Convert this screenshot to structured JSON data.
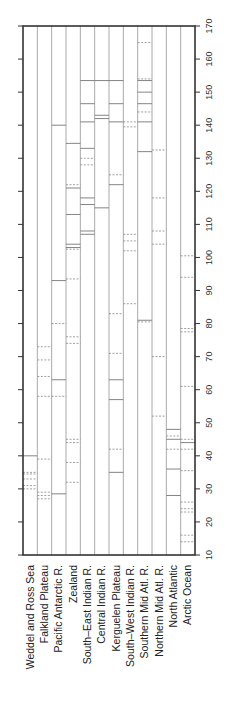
{
  "chart_data": {
    "type": "bar",
    "orientation": "rotated-90",
    "title": "",
    "xlabel": "",
    "ylabel": "",
    "ylim": [
      10,
      170
    ],
    "yticks": [
      10,
      20,
      30,
      40,
      50,
      60,
      70,
      80,
      90,
      100,
      110,
      120,
      130,
      140,
      150,
      160,
      170
    ],
    "categories": [
      "Weddel and Ross Sea",
      "Falkland Plateau",
      "Pacific Antarctic R.",
      "Zealand",
      "South-East Indian R.",
      "Central Indian R.",
      "Kerguelen Plateau",
      "South-West Indian R.",
      "Southern Mid Atl. R.",
      "Northern Mid Atl. R.",
      "North Atlantic",
      "Arctic Ocean"
    ],
    "columns": [
      {
        "solid": [
          40
        ],
        "dashed": [
          30,
          31,
          33,
          34.5,
          35
        ]
      },
      {
        "solid": [],
        "dashed": [
          27,
          28,
          29,
          39,
          58,
          64,
          69,
          73
        ]
      },
      {
        "solid": [
          28.5,
          63,
          93,
          140
        ],
        "dashed": [
          58,
          80
        ]
      },
      {
        "solid": [
          103,
          104,
          113,
          121,
          134.5
        ],
        "dashed": [
          32,
          38,
          44,
          45,
          74,
          76,
          93.5,
          102.5,
          122
        ]
      },
      {
        "solid": [
          107,
          108,
          116,
          118,
          133,
          141,
          146.5,
          153.5
        ],
        "dashed": [
          128,
          130
        ]
      },
      {
        "solid": [
          115,
          142,
          143,
          153.5
        ],
        "dashed": []
      },
      {
        "solid": [
          35,
          57,
          63,
          122,
          141,
          146.5,
          153.5
        ],
        "dashed": [
          42,
          71,
          83,
          125
        ]
      },
      {
        "solid": [],
        "dashed": [
          86,
          102,
          105,
          107,
          139.5,
          141
        ]
      },
      {
        "solid": [
          81,
          132,
          141,
          146.5,
          150,
          153.5
        ],
        "dashed": [
          80.5,
          144,
          154,
          165
        ]
      },
      {
        "solid": [],
        "dashed": [
          52,
          70,
          104,
          108,
          118,
          132.5
        ]
      },
      {
        "solid": [
          28,
          36,
          45,
          48
        ],
        "dashed": [
          42,
          46
        ]
      },
      {
        "solid": [
          44
        ],
        "dashed": [
          14,
          16,
          23,
          24,
          26,
          35.5,
          42,
          45,
          61,
          77.5,
          78.5,
          94,
          100.5
        ]
      }
    ],
    "grid": false,
    "legend": null
  }
}
